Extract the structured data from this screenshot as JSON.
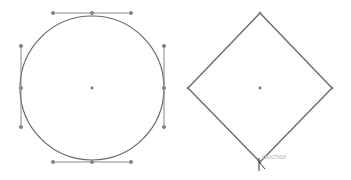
{
  "canvas": {
    "width": 351,
    "height": 180,
    "background": "#ffffff"
  },
  "stroke_color": "#6a6a6a",
  "handle_color": "#888888",
  "shapes": {
    "circle": {
      "center": [
        92,
        88
      ],
      "radius": 72
    },
    "diamond": {
      "top": [
        260,
        13
      ],
      "right": [
        332,
        88
      ],
      "bottom": [
        260,
        162
      ],
      "left": [
        188,
        88
      ],
      "center": [
        260,
        88
      ]
    }
  },
  "hover_label": "anchor"
}
